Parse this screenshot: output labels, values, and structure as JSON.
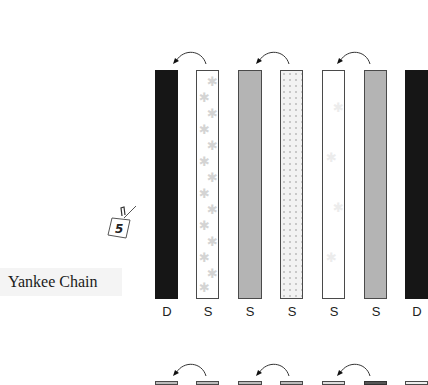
{
  "diagram": {
    "title": "Yankee Chain",
    "step_tag": "5",
    "strips": [
      {
        "label": "D",
        "fill": "dark"
      },
      {
        "label": "S",
        "fill": "floral"
      },
      {
        "label": "S",
        "fill": "gray"
      },
      {
        "label": "S",
        "fill": "dotted"
      },
      {
        "label": "S",
        "fill": "white"
      },
      {
        "label": "S",
        "fill": "gray"
      },
      {
        "label": "D",
        "fill": "dark"
      }
    ],
    "swap_arrows": 3,
    "colors": {
      "dark": "#161616",
      "gray": "#b4b4b4",
      "border": "#4a4a4a",
      "flower": "#d4d4d4"
    }
  }
}
